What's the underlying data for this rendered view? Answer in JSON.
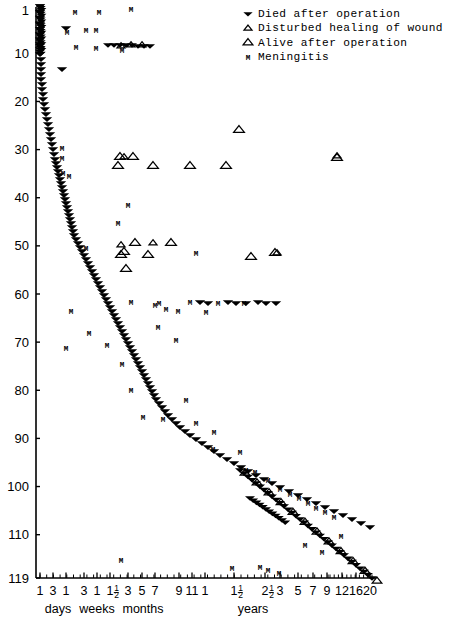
{
  "figure": {
    "kind": "survival-outcome-scatter",
    "background": "#ffffff",
    "ink_color": "#000000"
  },
  "legend": {
    "position": "top-right",
    "entries": [
      {
        "symbol": "filled-down-triangle",
        "icon_name": "died-marker-icon",
        "label": "Died after operation"
      },
      {
        "symbol": "small-open-up-triangle",
        "icon_name": "disturbed-healing-marker-icon",
        "label": "Disturbed healing of wound"
      },
      {
        "symbol": "open-up-triangle",
        "icon_name": "alive-marker-icon",
        "label": "Alive after operation"
      },
      {
        "symbol": "letter-M",
        "icon_name": "meningitis-marker-icon",
        "label": "Meningitis"
      }
    ]
  },
  "axes": {
    "y": {
      "label": "",
      "ticks": [
        1,
        10,
        20,
        30,
        40,
        50,
        60,
        70,
        80,
        90,
        100,
        110,
        119
      ],
      "min": 1,
      "max": 119,
      "direction": "top-to-bottom"
    },
    "x": {
      "label": "",
      "scale": "piecewise-log-time",
      "tick_labels": [
        "1",
        "3",
        "1",
        "3",
        "1",
        "1½",
        "3",
        "5",
        "7",
        "9",
        "11",
        "1",
        "1½",
        "2½",
        "3",
        "5",
        "7",
        "9",
        "12",
        "16",
        "20"
      ],
      "tick_positions": [
        40,
        53,
        66,
        84,
        97,
        110,
        128,
        142,
        155,
        179,
        192,
        205,
        234,
        265,
        280,
        298,
        313,
        327,
        342,
        356,
        370
      ],
      "groups": [
        {
          "label": "days",
          "x": 58
        },
        {
          "label": "weeks",
          "x": 97
        },
        {
          "label": "months",
          "x": 143
        },
        {
          "label": "years",
          "x": 253
        }
      ]
    }
  },
  "chart_data": {
    "type": "scatter",
    "title": "",
    "xlabel": "",
    "ylabel": "",
    "xlim": [
      36,
      372
    ],
    "ylim": [
      1,
      119
    ],
    "grid": false,
    "legend_position": "top-right",
    "series": [
      {
        "name": "Died after operation",
        "marker": "filled-down-triangle",
        "points": [
          [
            40,
            6
          ],
          [
            40,
            12
          ],
          [
            40,
            18
          ],
          [
            40,
            24
          ],
          [
            40,
            29
          ],
          [
            40,
            34
          ],
          [
            40,
            39
          ],
          [
            40,
            44
          ],
          [
            40,
            49
          ],
          [
            40,
            54
          ],
          [
            41,
            59
          ],
          [
            41,
            64
          ],
          [
            41,
            69
          ],
          [
            41,
            74
          ],
          [
            41,
            79
          ],
          [
            42,
            84
          ],
          [
            42,
            89
          ],
          [
            43,
            94
          ],
          [
            43,
            99
          ],
          [
            44,
            104
          ],
          [
            45,
            109
          ],
          [
            46,
            114
          ],
          [
            47,
            119
          ],
          [
            48,
            124
          ],
          [
            49,
            129
          ],
          [
            50,
            134
          ],
          [
            51,
            139
          ],
          [
            52,
            144
          ],
          [
            53,
            149
          ],
          [
            54,
            154
          ],
          [
            55,
            159
          ],
          [
            56,
            163
          ],
          [
            57,
            167
          ],
          [
            58,
            171
          ],
          [
            59,
            175
          ],
          [
            60,
            179
          ],
          [
            61,
            183
          ],
          [
            62,
            187
          ],
          [
            63,
            191
          ],
          [
            64,
            195
          ],
          [
            65,
            199
          ],
          [
            66,
            203
          ],
          [
            67,
            207
          ],
          [
            68,
            211
          ],
          [
            69,
            215
          ],
          [
            70,
            219
          ],
          [
            71,
            223
          ],
          [
            72,
            227
          ],
          [
            73,
            231
          ],
          [
            74,
            235
          ],
          [
            76,
            239
          ],
          [
            78,
            243
          ],
          [
            80,
            247
          ],
          [
            82,
            251
          ],
          [
            84,
            255
          ],
          [
            86,
            259
          ],
          [
            88,
            263
          ],
          [
            90,
            267
          ],
          [
            92,
            271
          ],
          [
            94,
            275
          ],
          [
            96,
            279
          ],
          [
            98,
            283
          ],
          [
            100,
            287
          ],
          [
            102,
            291
          ],
          [
            104,
            295
          ],
          [
            106,
            299
          ],
          [
            108,
            303
          ],
          [
            110,
            307
          ],
          [
            112,
            311
          ],
          [
            114,
            315
          ],
          [
            116,
            319
          ],
          [
            118,
            323
          ],
          [
            120,
            327
          ],
          [
            122,
            331
          ],
          [
            124,
            335
          ],
          [
            126,
            339
          ],
          [
            128,
            343
          ],
          [
            130,
            347
          ],
          [
            132,
            351
          ],
          [
            134,
            355
          ],
          [
            136,
            359
          ],
          [
            138,
            363
          ],
          [
            140,
            367
          ],
          [
            142,
            371
          ],
          [
            144,
            375
          ],
          [
            146,
            379
          ],
          [
            148,
            383
          ],
          [
            150,
            387
          ],
          [
            152,
            391
          ],
          [
            154,
            395
          ],
          [
            156,
            399
          ],
          [
            159,
            403
          ],
          [
            162,
            407
          ],
          [
            165,
            411
          ],
          [
            168,
            415
          ],
          [
            172,
            419
          ],
          [
            176,
            423
          ],
          [
            180,
            427
          ],
          [
            185,
            431
          ],
          [
            190,
            435
          ],
          [
            196,
            439
          ],
          [
            202,
            443
          ],
          [
            208,
            447
          ],
          [
            214,
            451
          ],
          [
            220,
            455
          ],
          [
            227,
            459
          ],
          [
            234,
            463
          ],
          [
            241,
            467
          ],
          [
            248,
            471
          ],
          [
            256,
            475
          ],
          [
            264,
            479
          ],
          [
            272,
            483
          ],
          [
            280,
            487
          ],
          [
            289,
            491
          ],
          [
            298,
            495
          ],
          [
            307,
            499
          ],
          [
            316,
            503
          ],
          [
            325,
            507
          ],
          [
            334,
            511
          ],
          [
            343,
            515
          ],
          [
            352,
            519
          ],
          [
            361,
            523
          ],
          [
            370,
            527
          ],
          [
            66,
            28
          ],
          [
            62,
            69
          ]
        ],
        "clusters": [
          {
            "x": 56,
            "y": 8,
            "note": "dense top cluster"
          },
          {
            "x": 300,
            "y": 500,
            "note": "dense bottom-right cluster"
          }
        ]
      },
      {
        "name": "Alive after operation",
        "marker": "open-up-triangle",
        "points": [
          [
            120,
            157
          ],
          [
            133,
            157
          ],
          [
            118,
            166
          ],
          [
            153,
            166
          ],
          [
            190,
            166
          ],
          [
            226,
            166
          ],
          [
            337,
            158
          ],
          [
            135,
            243
          ],
          [
            171,
            243
          ],
          [
            121,
            255
          ],
          [
            148,
            255
          ],
          [
            275,
            253
          ],
          [
            239,
            130
          ],
          [
            124,
            252
          ],
          [
            126,
            269
          ],
          [
            251,
            257
          ]
        ]
      },
      {
        "name": "Disturbed healing of wound",
        "marker": "small-open-up-triangle",
        "points": [
          [
            131,
            45
          ],
          [
            142,
            45
          ],
          [
            121,
            46
          ],
          [
            124,
            157
          ],
          [
            121,
            245
          ],
          [
            153,
            243
          ],
          [
            277,
            253
          ],
          [
            337,
            156
          ]
        ]
      },
      {
        "name": "Meningitis",
        "marker": "letter-M",
        "points": [
          [
            75,
            12
          ],
          [
            99,
            12
          ],
          [
            131,
            9
          ],
          [
            67,
            32
          ],
          [
            86,
            30
          ],
          [
            96,
            30
          ],
          [
            76,
            47
          ],
          [
            96,
            48
          ],
          [
            122,
            50
          ],
          [
            62,
            148
          ],
          [
            62,
            158
          ],
          [
            63,
            173
          ],
          [
            69,
            176
          ],
          [
            128,
            205
          ],
          [
            118,
            223
          ],
          [
            86,
            248
          ],
          [
            196,
            253
          ],
          [
            155,
            305
          ],
          [
            166,
            309
          ],
          [
            158,
            327
          ],
          [
            176,
            340
          ],
          [
            71,
            311
          ],
          [
            89,
            333
          ],
          [
            66,
            348
          ],
          [
            107,
            345
          ],
          [
            122,
            364
          ],
          [
            131,
            390
          ],
          [
            143,
            417
          ],
          [
            163,
            419
          ],
          [
            186,
            400
          ],
          [
            196,
            423
          ],
          [
            214,
            432
          ],
          [
            213,
            449
          ],
          [
            240,
            452
          ],
          [
            246,
            470
          ],
          [
            255,
            472
          ],
          [
            268,
            480
          ],
          [
            280,
            489
          ],
          [
            290,
            494
          ],
          [
            299,
            498
          ],
          [
            308,
            503
          ],
          [
            316,
            508
          ],
          [
            325,
            512
          ],
          [
            334,
            517
          ],
          [
            121,
            560
          ],
          [
            232,
            568
          ],
          [
            260,
            567
          ],
          [
            268,
            570
          ],
          [
            279,
            573
          ],
          [
            305,
            545
          ],
          [
            322,
            552
          ],
          [
            341,
            536
          ],
          [
            131,
            302
          ],
          [
            159,
            303
          ],
          [
            190,
            302
          ],
          [
            218,
            303
          ],
          [
            244,
            303
          ],
          [
            178,
            311
          ],
          [
            206,
            312
          ]
        ]
      }
    ],
    "annotations": []
  }
}
